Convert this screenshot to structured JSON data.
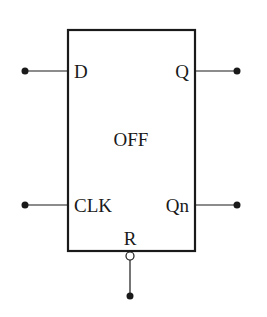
{
  "diagram": {
    "type": "flip-flop-block",
    "block_label": "OFF",
    "colors": {
      "stroke": "#1a1a1a",
      "background": "#ffffff"
    },
    "ports": {
      "d": {
        "label": "D",
        "side": "left"
      },
      "clk": {
        "label": "CLK",
        "side": "left"
      },
      "q": {
        "label": "Q",
        "side": "right"
      },
      "qn": {
        "label": "Qn",
        "side": "right"
      },
      "r": {
        "label": "R",
        "side": "bottom",
        "inverted": true
      }
    }
  }
}
